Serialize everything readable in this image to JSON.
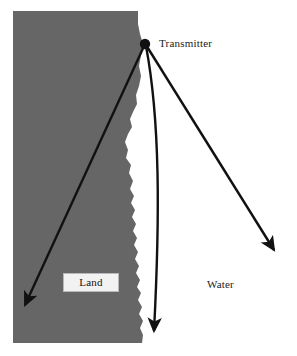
{
  "figure": {
    "width": 297,
    "height": 356,
    "background_color": "#ffffff"
  },
  "colors": {
    "land_fill": "#666666",
    "water_fill": "#ffffff",
    "stroke": "#111111",
    "label_box_fill": "#f2f2f2",
    "label_box_border": "#b9b9b9",
    "text": "#1a1a1a"
  },
  "labels": {
    "transmitter": "Transmitter",
    "land": "Land",
    "water": "Water"
  },
  "nodes": {
    "transmitter": {
      "x": 145,
      "y": 44,
      "radius": 5
    }
  },
  "rays": [
    {
      "name": "ray-over-land",
      "from": {
        "x": 145,
        "y": 44
      },
      "to": {
        "x": 21,
        "y": 311
      },
      "medium": "land",
      "curved": false
    },
    {
      "name": "ray-along-coast",
      "from": {
        "x": 145,
        "y": 44
      },
      "to": {
        "x": 155,
        "y": 338
      },
      "medium": "coastline",
      "curved": true
    },
    {
      "name": "ray-over-water",
      "from": {
        "x": 145,
        "y": 44
      },
      "to": {
        "x": 279,
        "y": 256
      },
      "medium": "water",
      "curved": false
    }
  ],
  "land_mass": {
    "top_left": {
      "x": 13,
      "y": 11
    },
    "bottom_left": {
      "x": 13,
      "y": 343
    },
    "top_right": {
      "x": 138,
      "y": 11
    },
    "bottom_right": {
      "x": 143,
      "y": 343
    },
    "coastline_description": "irregular ragged north-south shoreline between x=125 and x=148"
  }
}
